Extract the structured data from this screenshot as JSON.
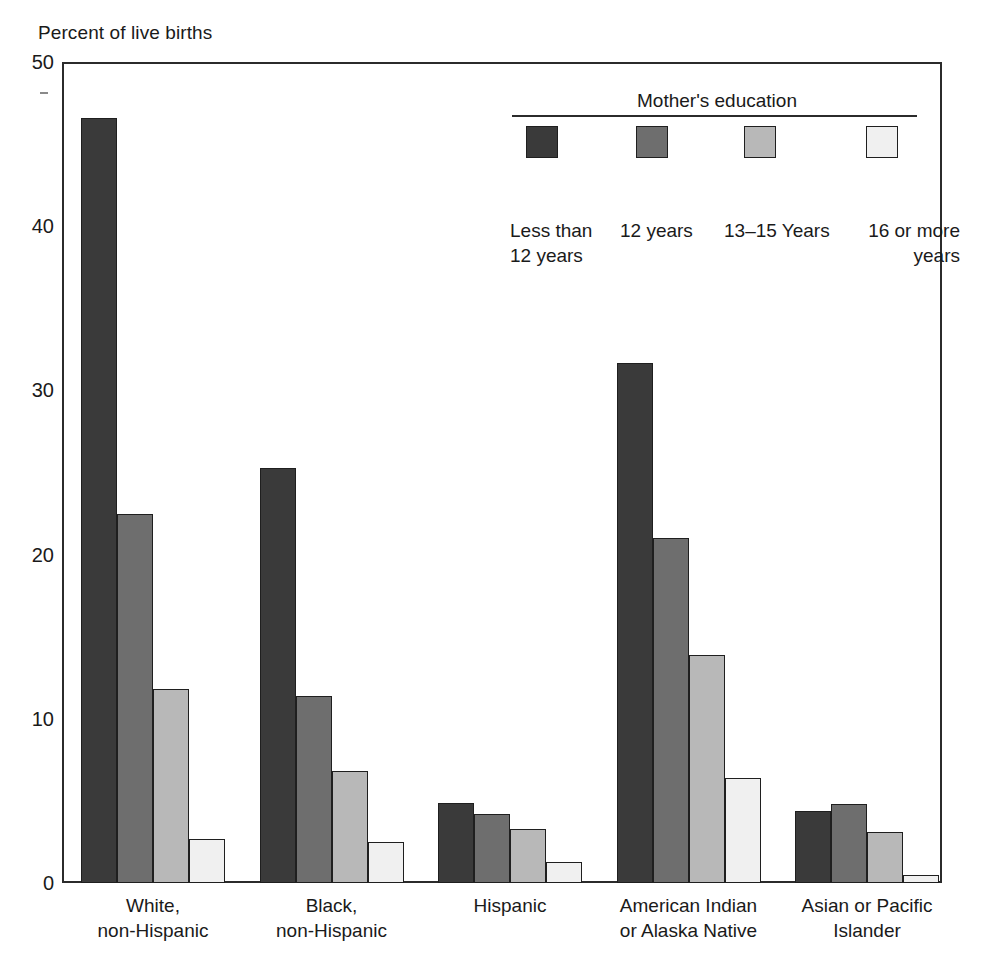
{
  "chart_data": {
    "type": "bar",
    "title": "Percent of live births",
    "xlabel": "",
    "ylabel": "Percent of live births",
    "ylim": [
      0,
      50
    ],
    "yticks": [
      0,
      10,
      20,
      30,
      40,
      50
    ],
    "grid": false,
    "legend_title": "Mother's education",
    "legend_position": "top-right",
    "categories": [
      "White,\nnon-Hispanic",
      "Black,\nnon-Hispanic",
      "Hispanic",
      "American Indian\nor Alaska Native",
      "Asian or Pacific\nIslander"
    ],
    "category_lines": [
      [
        "White,",
        "non-Hispanic"
      ],
      [
        "Black,",
        "non-Hispanic"
      ],
      [
        "Hispanic",
        ""
      ],
      [
        "American Indian",
        "or Alaska Native"
      ],
      [
        "Asian or Pacific",
        "Islander"
      ]
    ],
    "series": [
      {
        "name": "Less than 12 years",
        "name_lines": [
          "Less than",
          "12 years"
        ],
        "color": "#3a3a3a",
        "values": [
          46.6,
          25.3,
          4.9,
          31.7,
          4.4
        ]
      },
      {
        "name": "12 years",
        "name_lines": [
          "12 years",
          ""
        ],
        "color": "#6e6e6e",
        "values": [
          22.5,
          11.4,
          4.2,
          21.0,
          4.8
        ]
      },
      {
        "name": "13–15 Years",
        "name_lines": [
          "13–15 Years",
          ""
        ],
        "color": "#b8b8b8",
        "values": [
          11.8,
          6.8,
          3.3,
          13.9,
          3.1
        ]
      },
      {
        "name": "16 or more years",
        "name_lines": [
          "16 or more",
          "years"
        ],
        "color": "#f0f0f0",
        "values": [
          2.7,
          2.5,
          1.3,
          6.4,
          0.5
        ]
      }
    ]
  },
  "axis": {
    "y_label_top": "Percent of live births",
    "ticks": [
      "50",
      "40",
      "30",
      "20",
      "10",
      "0"
    ]
  },
  "legend": {
    "title": "Mother's education",
    "items": [
      {
        "label_line1": "Less than",
        "label_line2": "12 years"
      },
      {
        "label_line1": "12 years",
        "label_line2": ""
      },
      {
        "label_line1": "13–15 Years",
        "label_line2": ""
      },
      {
        "label_line1": "16 or more",
        "label_line2": "years"
      }
    ]
  }
}
